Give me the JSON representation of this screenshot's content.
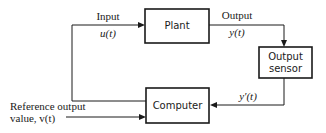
{
  "diagram": {
    "type": "block-diagram",
    "blocks": {
      "plant": "Plant",
      "computer": "Computer",
      "sensor_line1": "Output",
      "sensor_line2": "sensor"
    },
    "signals": {
      "input_label": "Input",
      "input_symbol": "u(t)",
      "output_label": "Output",
      "output_symbol": "y(t)",
      "measured_symbol": "y′(t)",
      "reference_line1": "Reference output",
      "reference_line2": "value, v(t)"
    }
  }
}
